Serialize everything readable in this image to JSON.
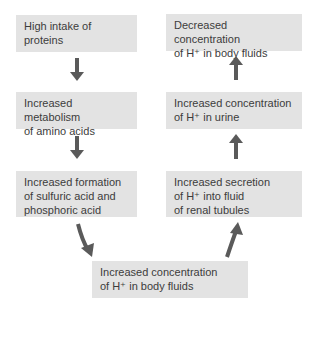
{
  "diagram": {
    "left_column": [
      {
        "id": "high-intake",
        "lines": [
          "High intake of",
          "proteins"
        ]
      },
      {
        "id": "metabolism",
        "lines": [
          "Increased metabolism",
          "of amino acids"
        ]
      },
      {
        "id": "acid-formation",
        "lines": [
          "Increased formation",
          "of sulfuric acid and",
          "phosphoric acid"
        ]
      }
    ],
    "bottom": {
      "id": "h-body-increase",
      "lines": [
        "Increased concentration",
        "of H⁺ in body fluids"
      ]
    },
    "right_column": [
      {
        "id": "h-body-decrease",
        "lines": [
          "Decreased concentration",
          "of H⁺ in body fluids"
        ]
      },
      {
        "id": "h-urine",
        "lines": [
          "Increased concentration",
          "of H⁺ in urine"
        ]
      },
      {
        "id": "h-secretion",
        "lines": [
          "Increased secretion",
          "of H⁺ into fluid",
          "of renal tubules"
        ]
      }
    ],
    "colors": {
      "box_fill": "#e3e3e3",
      "arrow": "#5a5a5a",
      "text": "#3c3c3c"
    }
  }
}
